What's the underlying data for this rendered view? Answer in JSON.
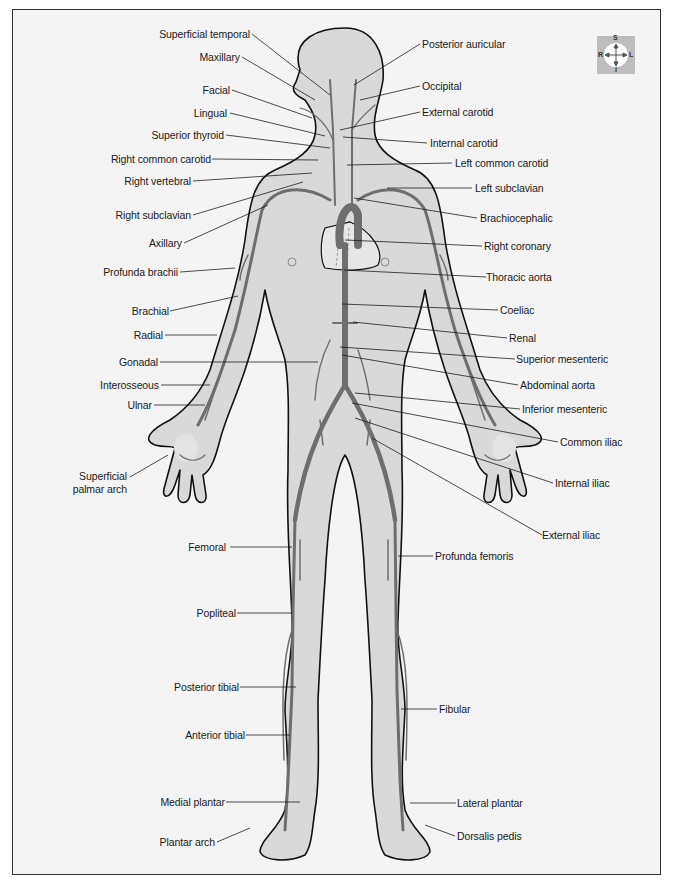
{
  "figure": {
    "colors": {
      "background": "#f4f4f4",
      "body_fill": "#d9d9d9",
      "outline": "#111111",
      "artery": "#6e6e6e",
      "heart_fill": "#e6e6e6"
    },
    "compass": {
      "top": "S",
      "bottom": "I",
      "left": "R",
      "right": "L"
    },
    "labels_left": [
      {
        "id": "superficial-temporal",
        "text": "Superficial temporal"
      },
      {
        "id": "maxillary",
        "text": "Maxillary"
      },
      {
        "id": "facial",
        "text": "Facial"
      },
      {
        "id": "lingual",
        "text": "Lingual"
      },
      {
        "id": "superior-thyroid",
        "text": "Superior thyroid"
      },
      {
        "id": "right-common-carotid",
        "text": "Right common carotid"
      },
      {
        "id": "right-vertebral",
        "text": "Right vertebral"
      },
      {
        "id": "right-subclavian",
        "text": "Right subclavian"
      },
      {
        "id": "axillary",
        "text": "Axillary"
      },
      {
        "id": "profunda-brachii",
        "text": "Profunda brachii"
      },
      {
        "id": "brachial",
        "text": "Brachial"
      },
      {
        "id": "radial",
        "text": "Radial"
      },
      {
        "id": "gonadal",
        "text": "Gonadal"
      },
      {
        "id": "interosseous",
        "text": "Interosseous"
      },
      {
        "id": "ulnar",
        "text": "Ulnar"
      },
      {
        "id": "superficial-palmar-arch-1",
        "text": "Superficial"
      },
      {
        "id": "superficial-palmar-arch-2",
        "text": "palmar arch"
      },
      {
        "id": "femoral",
        "text": "Femoral"
      },
      {
        "id": "popliteal",
        "text": "Popliteal"
      },
      {
        "id": "posterior-tibial",
        "text": "Posterior tibial"
      },
      {
        "id": "anterior-tibial",
        "text": "Anterior tibial"
      },
      {
        "id": "medial-plantar",
        "text": "Medial plantar"
      },
      {
        "id": "plantar-arch",
        "text": "Plantar arch"
      }
    ],
    "labels_right": [
      {
        "id": "posterior-auricular",
        "text": "Posterior auricular"
      },
      {
        "id": "occipital",
        "text": "Occipital"
      },
      {
        "id": "external-carotid",
        "text": "External carotid"
      },
      {
        "id": "internal-carotid",
        "text": "Internal carotid"
      },
      {
        "id": "left-common-carotid",
        "text": "Left common carotid"
      },
      {
        "id": "left-subclavian",
        "text": "Left subclavian"
      },
      {
        "id": "brachiocephalic",
        "text": "Brachiocephalic"
      },
      {
        "id": "right-coronary",
        "text": "Right coronary"
      },
      {
        "id": "thoracic-aorta",
        "text": "Thoracic aorta"
      },
      {
        "id": "coeliac",
        "text": "Coeliac"
      },
      {
        "id": "renal",
        "text": "Renal"
      },
      {
        "id": "superior-mesenteric",
        "text": "Superior mesenteric"
      },
      {
        "id": "abdominal-aorta",
        "text": "Abdominal aorta"
      },
      {
        "id": "inferior-mesenteric",
        "text": "Inferior mesenteric"
      },
      {
        "id": "common-iliac",
        "text": "Common iliac"
      },
      {
        "id": "internal-iliac",
        "text": "Internal iliac"
      },
      {
        "id": "external-iliac",
        "text": "External iliac"
      },
      {
        "id": "profunda-femoris",
        "text": "Profunda femoris"
      },
      {
        "id": "fibular",
        "text": "Fibular"
      },
      {
        "id": "lateral-plantar",
        "text": "Lateral plantar"
      },
      {
        "id": "dorsalis-pedis",
        "text": "Dorsalis pedis"
      }
    ]
  }
}
